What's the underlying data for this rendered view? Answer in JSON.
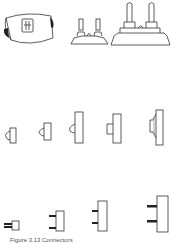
{
  "figure": {
    "caption": "Figure 3.13  Connectors",
    "stroke_color": "#333333",
    "fill_dark": "#222222",
    "rows": [
      {
        "name": "row-top",
        "items": [
          "curved-connector-body",
          "small-twin-post-insulator",
          "large-twin-post-insulator"
        ]
      },
      {
        "name": "row-middle",
        "items": [
          "dome-connector-1",
          "dome-connector-2",
          "dome-connector-3",
          "block-connector-4",
          "stepped-connector-5"
        ]
      },
      {
        "name": "row-bottom",
        "items": [
          "pin-connector-1",
          "pin-connector-2",
          "pin-connector-3",
          "pin-connector-4"
        ]
      }
    ]
  }
}
